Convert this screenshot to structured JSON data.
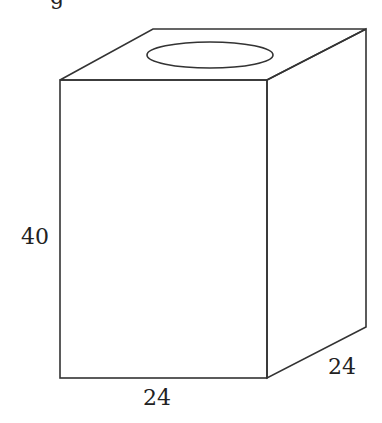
{
  "figure": {
    "type": "rectangular-box-with-circular-opening",
    "stroke_color": "#333333",
    "background_color": "#ffffff",
    "partial_text_top": "g",
    "labels": {
      "height": "40",
      "width": "24",
      "depth": "24"
    },
    "vertices": {
      "front_top_left": [
        60,
        80
      ],
      "front_top_right": [
        267,
        80
      ],
      "front_bottom_left": [
        60,
        378
      ],
      "front_bottom_right": [
        267,
        378
      ],
      "back_top_left": [
        153,
        29
      ],
      "back_top_right": [
        366,
        29
      ],
      "back_bottom_right": [
        366,
        327
      ]
    },
    "opening": {
      "cx": 210,
      "cy": 55,
      "rx": 63,
      "ry": 13
    }
  }
}
